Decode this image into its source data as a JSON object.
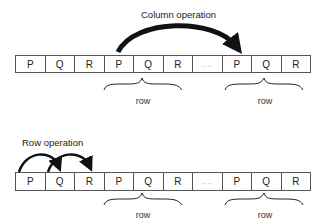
{
  "column_section": {
    "title": "Column operation",
    "cells": [
      "P",
      "Q",
      "R",
      "P",
      "Q",
      "R",
      "....",
      "P",
      "Q",
      "R"
    ],
    "braces": [
      {
        "label": "row"
      },
      {
        "label": "row"
      }
    ]
  },
  "row_section": {
    "title": "Row operation",
    "cells": [
      "P",
      "Q",
      "R",
      "P",
      "Q",
      "R",
      "....",
      "P",
      "Q",
      "R"
    ],
    "braces": [
      {
        "label": "row"
      },
      {
        "label": "row"
      }
    ]
  }
}
